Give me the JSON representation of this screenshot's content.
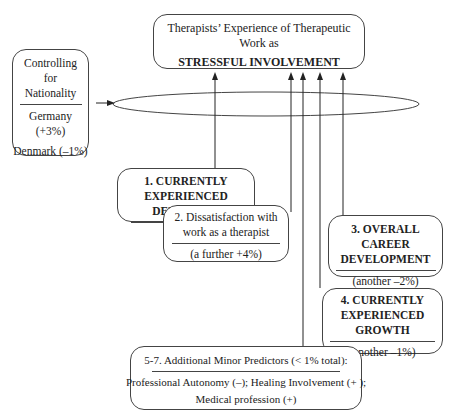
{
  "target": {
    "line1": "Therapists’ Experience of Therapeutic Work as",
    "line2": "STRESSFUL INVOLVEMENT"
  },
  "control": {
    "title": [
      "Controlling",
      "for",
      "Nationality"
    ],
    "items": [
      "Germany (+3%)",
      "Denmark (–1%)"
    ]
  },
  "predictors": [
    {
      "id": "1",
      "title": "1. CURRENTLY EXPERIENCED DEPLETION",
      "value": "(+19%)"
    },
    {
      "id": "2",
      "title": "2. Dissatisfaction with work as a therapist",
      "value": "(a further +4%)"
    },
    {
      "id": "3",
      "title": "3. OVERALL CAREER DEVELOPMENT",
      "value": "(another –2%)"
    },
    {
      "id": "4",
      "title": "4. CURRENTLY EXPERIENCED GROWTH",
      "value": "(another –1%)"
    },
    {
      "id": "5-7",
      "title": "5-7. Additional Minor Predictors (< 1% total):",
      "value": "Professional Autonomy (–); Healing Involvement (+ );",
      "value2": "Medical profession (+)"
    }
  ]
}
